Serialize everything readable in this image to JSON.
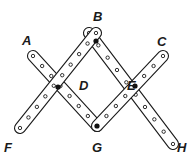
{
  "diagram": {
    "type": "linkage",
    "colors": {
      "stroke": "#1a1a1a",
      "fill": "#ffffff",
      "pin": "#111111"
    },
    "labels": [
      {
        "id": "A",
        "text": "A",
        "x": 22,
        "y": 34
      },
      {
        "id": "B",
        "text": "B",
        "x": 93,
        "y": 10
      },
      {
        "id": "C",
        "text": "C",
        "x": 157,
        "y": 35
      },
      {
        "id": "D",
        "text": "D",
        "x": 79,
        "y": 79
      },
      {
        "id": "E",
        "text": "E",
        "x": 127,
        "y": 79
      },
      {
        "id": "F",
        "text": "F",
        "x": 4,
        "y": 141
      },
      {
        "id": "G",
        "text": "G",
        "x": 92,
        "y": 141
      },
      {
        "id": "H",
        "text": "H",
        "x": 177,
        "y": 141
      }
    ],
    "pins": [
      {
        "id": "B",
        "x": 96,
        "y": 41
      },
      {
        "id": "D",
        "x": 58,
        "y": 87
      },
      {
        "id": "E",
        "x": 135,
        "y": 86
      },
      {
        "id": "G",
        "x": 97,
        "y": 126
      }
    ],
    "strips": [
      {
        "id": "A-G",
        "x1": 33,
        "y1": 56,
        "x2": 97,
        "y2": 126,
        "holes": 8
      },
      {
        "id": "B-H",
        "x1": 89,
        "y1": 33,
        "x2": 173,
        "y2": 144,
        "holes": 10
      },
      {
        "id": "F-B",
        "x1": 20,
        "y1": 128,
        "x2": 96,
        "y2": 33,
        "holes": 10
      },
      {
        "id": "G-C",
        "x1": 97,
        "y1": 126,
        "x2": 163,
        "y2": 56,
        "holes": 8
      }
    ]
  }
}
